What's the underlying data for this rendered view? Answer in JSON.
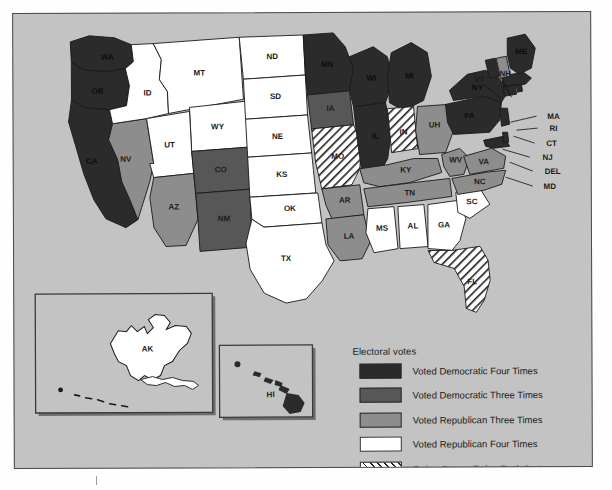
{
  "map": {
    "title": "United States Electoral Vote Map",
    "background_color": "#c3c3c3",
    "border_color": "#4a4a4a"
  },
  "legend": {
    "title": "Electoral votes",
    "items": [
      {
        "label": "Voted Democratic Four Times",
        "key": "dem4",
        "color": "#2b2b2b",
        "pattern": "solid"
      },
      {
        "label": "Voted Democratic Three Times",
        "key": "dem3",
        "color": "#575757",
        "pattern": "solid"
      },
      {
        "label": "Voted Republican Three Times",
        "key": "rep3",
        "color": "#8d8d8d",
        "pattern": "solid"
      },
      {
        "label": "Voted Republican Four Times",
        "key": "rep4",
        "color": "#ffffff",
        "pattern": "solid"
      },
      {
        "label": "Swing State—Twice Each Party",
        "key": "swing",
        "color": "#ffffff",
        "pattern": "hatch"
      }
    ]
  },
  "insets": [
    {
      "name": "alaska-inset",
      "label": "AK"
    },
    {
      "name": "hawaii-inset",
      "label": "HI"
    }
  ],
  "chart_data": {
    "type": "map",
    "title": "Electoral votes",
    "categories": [
      "Voted Democratic Four Times",
      "Voted Democratic Three Times",
      "Voted Republican Three Times",
      "Voted Republican Four Times",
      "Swing State—Twice Each Party"
    ],
    "category_colors": [
      "#2b2b2b",
      "#575757",
      "#8d8d8d",
      "#ffffff",
      "hatched"
    ],
    "counts": {
      "dem4": 17,
      "dem3": 7,
      "rep3": 11,
      "rep4": 13,
      "swing": 3
    },
    "states": [
      {
        "code": "WA",
        "label": "WA",
        "category": "dem4"
      },
      {
        "code": "OR",
        "label": "OR",
        "category": "dem4"
      },
      {
        "code": "CA",
        "label": "CA",
        "category": "dem4"
      },
      {
        "code": "NV",
        "label": "NV",
        "category": "rep3"
      },
      {
        "code": "ID",
        "label": "ID",
        "category": "rep4"
      },
      {
        "code": "MT",
        "label": "MT",
        "category": "rep4"
      },
      {
        "code": "WY",
        "label": "WY",
        "category": "rep4"
      },
      {
        "code": "UT",
        "label": "UT",
        "category": "rep4"
      },
      {
        "code": "AZ",
        "label": "AZ",
        "category": "rep3"
      },
      {
        "code": "CO",
        "label": "CO",
        "category": "dem3"
      },
      {
        "code": "NM",
        "label": "NM",
        "category": "dem3"
      },
      {
        "code": "ND",
        "label": "ND",
        "category": "rep4"
      },
      {
        "code": "SD",
        "label": "SD",
        "category": "rep4"
      },
      {
        "code": "NE",
        "label": "NE",
        "category": "rep4"
      },
      {
        "code": "KS",
        "label": "KS",
        "category": "rep4"
      },
      {
        "code": "OK",
        "label": "OK",
        "category": "rep4"
      },
      {
        "code": "TX",
        "label": "TX",
        "category": "rep4"
      },
      {
        "code": "MN",
        "label": "MN",
        "category": "dem4"
      },
      {
        "code": "IA",
        "label": "IA",
        "category": "dem3"
      },
      {
        "code": "MO",
        "label": "MO",
        "category": "swing"
      },
      {
        "code": "AR",
        "label": "AR",
        "category": "rep3"
      },
      {
        "code": "LA",
        "label": "LA",
        "category": "rep3"
      },
      {
        "code": "WI",
        "label": "WI",
        "category": "dem4"
      },
      {
        "code": "IL",
        "label": "IL",
        "category": "dem4"
      },
      {
        "code": "MI",
        "label": "MI",
        "category": "dem4"
      },
      {
        "code": "IN",
        "label": "IN",
        "category": "swing"
      },
      {
        "code": "OH",
        "label": "UH",
        "category": "rep3"
      },
      {
        "code": "KY",
        "label": "KY",
        "category": "rep3"
      },
      {
        "code": "TN",
        "label": "TN",
        "category": "rep3"
      },
      {
        "code": "MS",
        "label": "MS",
        "category": "rep4"
      },
      {
        "code": "AL",
        "label": "AL",
        "category": "rep4"
      },
      {
        "code": "GA",
        "label": "GA",
        "category": "rep4"
      },
      {
        "code": "SC",
        "label": "SC",
        "category": "rep4"
      },
      {
        "code": "NC",
        "label": "NC",
        "category": "rep3"
      },
      {
        "code": "FL",
        "label": "FL",
        "category": "swing"
      },
      {
        "code": "WV",
        "label": "WV",
        "category": "rep3"
      },
      {
        "code": "VA",
        "label": "VA",
        "category": "rep3"
      },
      {
        "code": "MD",
        "label": "MD",
        "category": "dem4"
      },
      {
        "code": "DEL",
        "label": "DEL",
        "category": "dem4"
      },
      {
        "code": "PA",
        "label": "PA",
        "category": "dem4"
      },
      {
        "code": "NJ",
        "label": "NJ",
        "category": "dem4"
      },
      {
        "code": "NY",
        "label": "NY",
        "category": "dem4"
      },
      {
        "code": "CT",
        "label": "CT",
        "category": "dem4"
      },
      {
        "code": "RI",
        "label": "RI",
        "category": "dem4"
      },
      {
        "code": "MA",
        "label": "MA",
        "category": "dem4"
      },
      {
        "code": "VT",
        "label": "VT",
        "category": "dem4"
      },
      {
        "code": "NH",
        "label": "NH",
        "category": "rep3"
      },
      {
        "code": "ME",
        "label": "ME",
        "category": "dem4"
      },
      {
        "code": "AK",
        "label": "AK",
        "category": "rep4"
      },
      {
        "code": "HI",
        "label": "HI",
        "category": "dem4"
      }
    ]
  }
}
